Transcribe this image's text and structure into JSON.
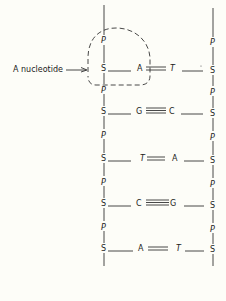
{
  "diagram": {
    "type": "DNA double-helix ladder schematic",
    "annotation": {
      "label": "A nucleotide",
      "arrow": "right"
    },
    "backbone_symbols": {
      "sugar": "S",
      "phosphate": "P"
    },
    "strands": {
      "left": [
        "P",
        "S",
        "P",
        "S",
        "P",
        "S",
        "P",
        "S",
        "P",
        "S"
      ],
      "right": [
        "P",
        "S",
        "P",
        "S",
        "P",
        "S",
        "P",
        "S",
        "P",
        "S"
      ]
    },
    "base_pairs": [
      {
        "left": "A",
        "right": "T",
        "bond": "double"
      },
      {
        "left": "G",
        "right": "C",
        "bond": "triple"
      },
      {
        "left": "T",
        "right": "A",
        "bond": "double"
      },
      {
        "left": "C",
        "right": "G",
        "bond": "triple"
      },
      {
        "left": "A",
        "right": "T",
        "bond": "double"
      }
    ],
    "highlight": {
      "shape": "dashed-outline",
      "encloses": "P-S-A nucleotide"
    },
    "colors": {
      "ink": "#333333",
      "background": "#fdfdf8"
    }
  }
}
